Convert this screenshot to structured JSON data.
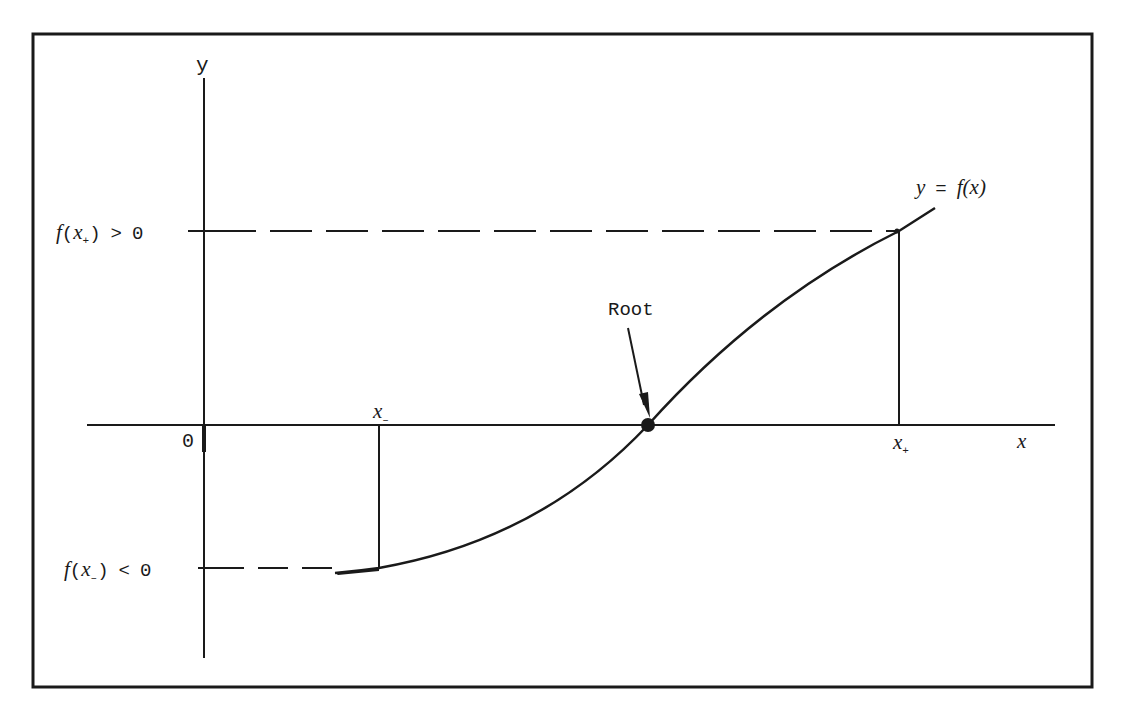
{
  "diagram": {
    "title": "",
    "colors": {
      "ink": "#1a1a1a",
      "background": "#ffffff"
    },
    "axes": {
      "y_label": "y",
      "x_label": "x",
      "origin_label": "0"
    },
    "curve_label": {
      "lhs": "y",
      "eq": "=",
      "rhs_func": "f",
      "rhs_arg": "(x)"
    },
    "root_label": "Root",
    "x_minus": {
      "var": "x",
      "sub": "–"
    },
    "x_plus": {
      "var": "x",
      "sub": "+"
    },
    "f_plus_condition": {
      "func": "f",
      "open": "(",
      "var": "x",
      "sub": "+",
      "close": ")",
      "rel": ">",
      "val": "0"
    },
    "f_minus_condition": {
      "func": "f",
      "open": "(",
      "var": "x",
      "sub": "–",
      "close": ")",
      "rel": "<",
      "val": "0"
    },
    "stray_mark": "+"
  }
}
